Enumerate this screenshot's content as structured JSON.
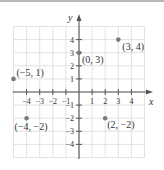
{
  "chart_data": {
    "type": "scatter",
    "title": "",
    "xlabel": "x",
    "ylabel": "y",
    "xlim": [
      -5,
      5
    ],
    "ylim": [
      -5,
      5
    ],
    "grid": true,
    "x_ticks": [
      -4,
      -3,
      -2,
      -1,
      1,
      2,
      3,
      4
    ],
    "y_ticks": [
      4,
      3,
      2,
      1,
      -1,
      -2,
      -3,
      -4
    ],
    "x_tick_labels": [
      "−4",
      "−3",
      "−2",
      "−1",
      "1",
      "2",
      "3",
      "4"
    ],
    "y_tick_labels": [
      "4",
      "3",
      "2",
      "1",
      "−1",
      "−2",
      "−3",
      "−4"
    ],
    "points": [
      {
        "x": 3,
        "y": 4,
        "label": "(3, 4)"
      },
      {
        "x": 0,
        "y": 3,
        "label": "(0, 3)"
      },
      {
        "x": -5,
        "y": 1,
        "label": "(−5, 1)"
      },
      {
        "x": -4,
        "y": -2,
        "label": "(−4, −2)"
      },
      {
        "x": 2,
        "y": -2,
        "label": "(2, −2)"
      }
    ]
  },
  "colors": {
    "grid": "#e2e2e2",
    "axis": "#555555",
    "point": "#7a7a7a",
    "text": "#333333"
  },
  "axes": {
    "x_name": "x",
    "y_name": "y"
  }
}
